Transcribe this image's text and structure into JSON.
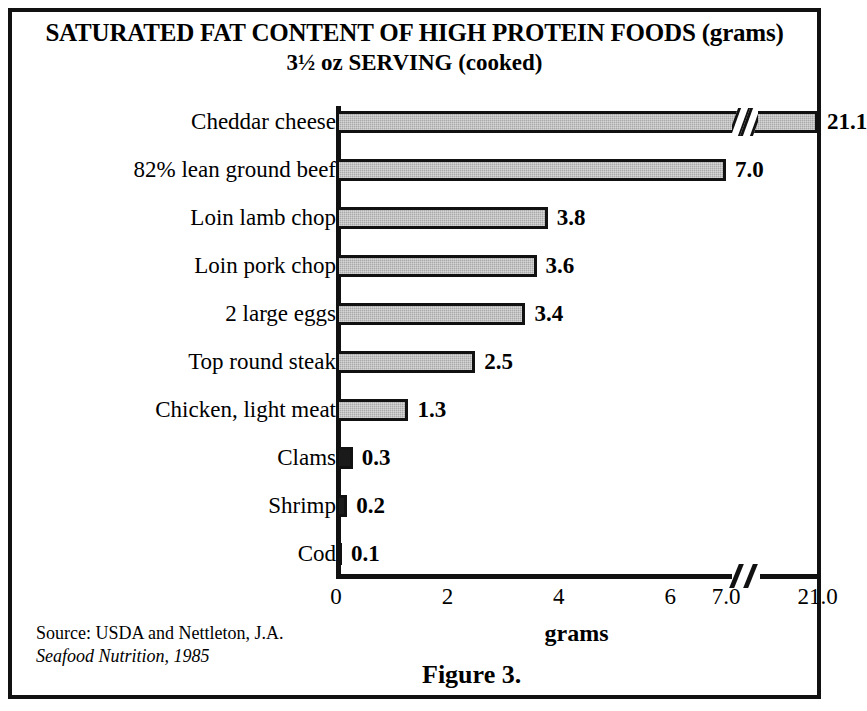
{
  "figure": {
    "title_line_1": "SATURATED FAT CONTENT OF HIGH PROTEIN FOODS (grams)",
    "title_line_2": "3½ oz SERVING (cooked)",
    "caption": "Figure 3.",
    "source_line_1": "Source: USDA and Nettleton, J.A.",
    "source_line_2": "Seafood Nutrition, 1985"
  },
  "colors": {
    "bar_gray": "#a9a9a9",
    "bar_dark": "#1a1a1a",
    "outline": "#111111",
    "background": "#ffffff"
  },
  "chart_data": {
    "type": "bar",
    "orientation": "horizontal",
    "title": "SATURATED FAT CONTENT OF HIGH PROTEIN FOODS (grams) 3½ oz SERVING (cooked)",
    "xlabel": "grams",
    "ylabel": "",
    "grid": false,
    "legend": null,
    "axis_break": {
      "between": [
        7.0,
        21.0
      ],
      "shown": true
    },
    "xlim": [
      0,
      21.1
    ],
    "xticks": [
      "0",
      "2",
      "4",
      "6",
      "7.0",
      "21.0"
    ],
    "xtick_values": [
      0,
      2,
      4,
      6,
      7.0,
      21.0
    ],
    "categories": [
      "Cheddar cheese",
      "82% lean ground beef",
      "Loin lamb chop",
      "Loin pork chop",
      "2 large eggs",
      "Top round steak",
      "Chicken, light meat",
      "Clams",
      "Shrimp",
      "Cod"
    ],
    "values": [
      21.1,
      7.0,
      3.8,
      3.6,
      3.4,
      2.5,
      1.3,
      0.3,
      0.2,
      0.1
    ],
    "value_labels": [
      "21.1",
      "7.0",
      "3.8",
      "3.6",
      "3.4",
      "2.5",
      "1.3",
      "0.3",
      "0.2",
      "0.1"
    ],
    "bar_styles": [
      "gray",
      "gray",
      "gray",
      "gray",
      "gray",
      "gray",
      "gray",
      "dark",
      "dark",
      "dark"
    ]
  }
}
